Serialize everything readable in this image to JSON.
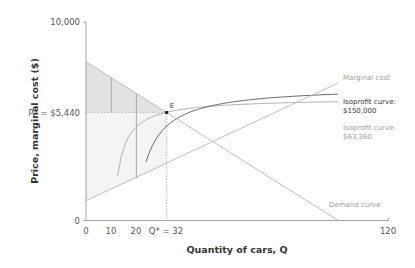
{
  "chart_data": {
    "type": "line",
    "title": "",
    "xlabel": "Quantity of cars, Q",
    "ylabel": "Price, marginal cost ($)",
    "xlim": [
      0,
      120
    ],
    "ylim": [
      0,
      10000
    ],
    "x_ticks": [
      "0",
      "10",
      "20",
      "Q* = 32",
      "120"
    ],
    "x_tick_values": [
      0,
      10,
      20,
      32,
      120
    ],
    "y_ticks": [
      "0",
      "P* = $5,440",
      "10,000"
    ],
    "y_tick_values": [
      0,
      5440,
      10000
    ],
    "grid": false,
    "series": [
      {
        "name": "Demand curve",
        "type": "line",
        "x": [
          0,
          100
        ],
        "y": [
          8000,
          0
        ],
        "color": "#b0b0b0"
      },
      {
        "name": "Marginal cost",
        "type": "line",
        "x": [
          0,
          100
        ],
        "y": [
          1000,
          6600
        ],
        "color": "#b0b0b0"
      },
      {
        "name": "Isoprofit curve: $63,360",
        "type": "curve",
        "profit": 63360,
        "color": "#9a9a9a"
      },
      {
        "name": "Isoprofit curve: $150,000",
        "type": "curve",
        "profit": 150000,
        "color": "#555555"
      }
    ],
    "annotations": [
      {
        "text": "E",
        "x": 32,
        "y": 5440,
        "note": "profit-maximizing point"
      },
      {
        "text": "P* = $5,440",
        "axis": "y"
      },
      {
        "text": "Q* = 32",
        "axis": "x"
      }
    ],
    "shaded_regions": [
      {
        "name": "consumer surplus",
        "from_price": 5440,
        "to": "demand",
        "q_range": [
          0,
          32
        ],
        "color": "#e3e3e3",
        "dividers_q": [
          10,
          20
        ]
      },
      {
        "name": "producer surplus",
        "from_price": 5440,
        "to": "marginal cost",
        "q_range": [
          0,
          32
        ],
        "color": "#f4f4f4",
        "dividers_q": [
          20
        ]
      }
    ],
    "equilibrium": {
      "Q": 32,
      "P": 5440
    }
  },
  "labels": {
    "y_axis_title": "Price, marginal cost ($)",
    "x_axis_title": "Quantity of cars, Q",
    "y_top": "10,000",
    "y_zero": "0",
    "y_pstar": "P* = $5,440",
    "x_0": "0",
    "x_10": "10",
    "x_20": "20",
    "x_qstar": "Q* = 32",
    "x_120": "120",
    "point_e": "E",
    "mc_label": "Marginal cost",
    "iso_high_line1": "Isoprofit curve:",
    "iso_high_line2": "$150,000",
    "iso_low_line1": "Isoprofit curve:",
    "iso_low_line2": "$63,360",
    "demand_label": "Demand curve"
  }
}
